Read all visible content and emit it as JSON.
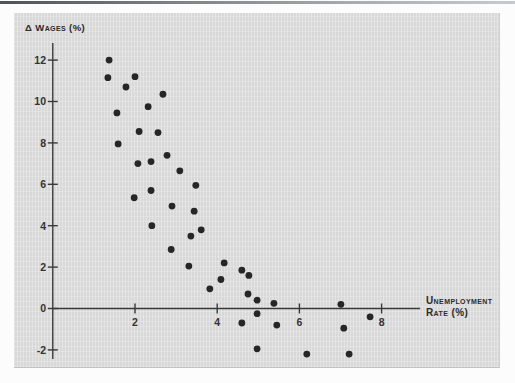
{
  "figure": {
    "y_axis_label": "Δ Wages (%)",
    "x_axis_label_line1": "Unemployment",
    "x_axis_label_line2": "Rate (%)"
  },
  "colors": {
    "panel": "#d8d8d8",
    "axis": "#3a3a3a",
    "dot": "#262626",
    "tick_label": "#333333",
    "label": "#2b2b2b"
  },
  "chart_data": {
    "type": "scatter",
    "title": "",
    "xlabel": "Unemployment rate (%)",
    "ylabel": "Δ Wages (%)",
    "legend": "none",
    "grid": "off",
    "x_ticks": [
      2,
      4,
      6,
      8
    ],
    "y_ticks": [
      12,
      10,
      8,
      6,
      4,
      2,
      0,
      -2
    ],
    "xlim": [
      0,
      8.9
    ],
    "ylim": [
      -2.45,
      12.85
    ],
    "points": [
      [
        1.37,
        12.0
      ],
      [
        1.34,
        11.15
      ],
      [
        2.0,
        11.2
      ],
      [
        1.78,
        10.7
      ],
      [
        2.68,
        10.35
      ],
      [
        2.32,
        9.75
      ],
      [
        1.56,
        9.45
      ],
      [
        2.1,
        8.55
      ],
      [
        2.56,
        8.5
      ],
      [
        1.59,
        7.95
      ],
      [
        2.78,
        7.4
      ],
      [
        2.07,
        7.0
      ],
      [
        2.39,
        7.1
      ],
      [
        3.09,
        6.65
      ],
      [
        3.48,
        5.95
      ],
      [
        2.39,
        5.7
      ],
      [
        1.98,
        5.35
      ],
      [
        2.9,
        4.95
      ],
      [
        3.44,
        4.7
      ],
      [
        2.41,
        4.0
      ],
      [
        3.61,
        3.8
      ],
      [
        3.36,
        3.5
      ],
      [
        2.88,
        2.85
      ],
      [
        3.31,
        2.05
      ],
      [
        4.17,
        2.2
      ],
      [
        4.6,
        1.85
      ],
      [
        4.77,
        1.6
      ],
      [
        4.09,
        1.4
      ],
      [
        3.82,
        0.95
      ],
      [
        4.75,
        0.7
      ],
      [
        4.97,
        0.4
      ],
      [
        5.38,
        0.25
      ],
      [
        4.97,
        -0.25
      ],
      [
        4.6,
        -0.7
      ],
      [
        5.45,
        -0.8
      ],
      [
        4.97,
        -1.95
      ],
      [
        6.18,
        -2.2
      ],
      [
        7.01,
        0.2
      ],
      [
        7.08,
        -0.95
      ],
      [
        7.72,
        -0.4
      ],
      [
        7.21,
        -2.2
      ]
    ]
  }
}
